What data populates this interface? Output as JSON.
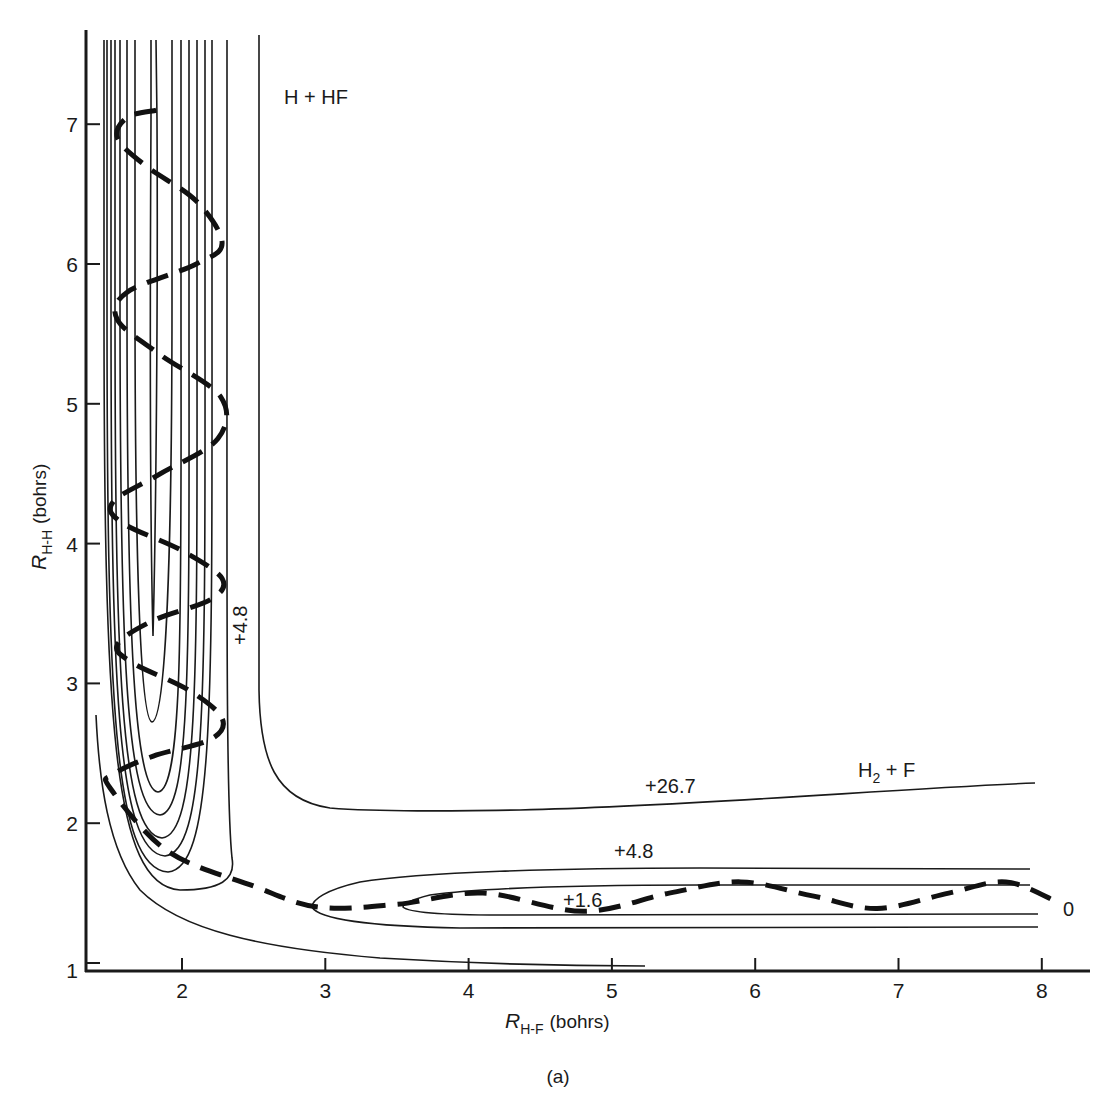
{
  "chart_data": {
    "type": "contour",
    "title": "",
    "panel_label": "(a)",
    "xlabel": "R_H-F (bohrs)",
    "xlabel_main": "R",
    "xlabel_sub": "H-F",
    "xlabel_unit": "(bohrs)",
    "ylabel": "R_H-H (bohrs)",
    "ylabel_main": "R",
    "ylabel_sub": "H-H",
    "ylabel_unit": "(bohrs)",
    "xlim": [
      1.3,
      8.3
    ],
    "ylim": [
      1.0,
      7.6
    ],
    "x_ticks": [
      "2",
      "3",
      "4",
      "5",
      "6",
      "7",
      "8"
    ],
    "y_ticks": [
      "1",
      "2",
      "3",
      "4",
      "5",
      "6",
      "7"
    ],
    "grid": false,
    "regions": [
      {
        "label": "H + HF",
        "x": 2.8,
        "y": 7.1
      },
      {
        "label_main": "H",
        "label_sub": "2",
        "label_rest": " + F",
        "label": "H2 + F",
        "x": 7.0,
        "y": 2.2
      }
    ],
    "contour_labels": [
      {
        "value": "+26.7",
        "x": 5.25,
        "y": 2.22
      },
      {
        "value": "+4.8",
        "x": 4.97,
        "y": 1.76
      },
      {
        "value": "+1.6",
        "x": 4.3,
        "y": 1.48
      },
      {
        "value": "+4.8",
        "x": 2.38,
        "y": 3.35,
        "rotated": true
      },
      {
        "value": "0",
        "x": 8.2,
        "y": 1.44
      }
    ],
    "contours": [
      {
        "name": "+26.7",
        "description": "L-shaped contour: vertical at R_HF≈2.55 from R_HH 7.6 down to ~2.5, then horizontal at R_HH≈2.1–2.2 out to R_HF=8"
      },
      {
        "name": "+4.8 (product valley)",
        "description": "closed loop from R_HF≈2.9 to 8, R_HH between ~1.28 and ~1.72"
      },
      {
        "name": "+1.6 (product valley)",
        "description": "closed loop from R_HF≈3.55 to 8, R_HH between ~1.38 and ~1.6"
      },
      {
        "name": "repulsive wall",
        "description": "curve from (1.4, 2.8) sweeping down to (5.3, 1.03)"
      },
      {
        "name": "reactant valley family",
        "description": "nested U-shaped contours in HF channel near R_HF≈1.5–2.3, bottoms from R_HH≈3.35 down to ≈1.6"
      }
    ],
    "series": [
      {
        "name": "trajectory",
        "style": "dashed",
        "x": [
          1.82,
          1.62,
          1.55,
          1.75,
          2.1,
          2.28,
          2.1,
          1.62,
          1.55,
          1.85,
          2.27,
          2.25,
          1.85,
          1.52,
          1.58,
          2.0,
          2.28,
          2.2,
          1.8,
          1.55,
          1.65,
          2.05,
          2.28,
          2.2,
          1.8,
          1.52,
          1.5,
          1.9,
          2.5,
          2.95,
          3.5,
          4.1,
          4.8,
          5.4,
          5.9,
          6.4,
          6.85,
          7.35,
          7.75,
          8.1
        ],
        "y": [
          7.1,
          7.05,
          6.9,
          6.7,
          6.45,
          6.15,
          6.0,
          5.8,
          5.6,
          5.35,
          5.05,
          4.75,
          4.5,
          4.3,
          4.15,
          3.95,
          3.75,
          3.6,
          3.45,
          3.28,
          3.15,
          2.95,
          2.75,
          2.6,
          2.48,
          2.35,
          2.25,
          1.8,
          1.55,
          1.4,
          1.42,
          1.5,
          1.37,
          1.5,
          1.58,
          1.48,
          1.39,
          1.5,
          1.58,
          1.44
        ]
      }
    ]
  }
}
